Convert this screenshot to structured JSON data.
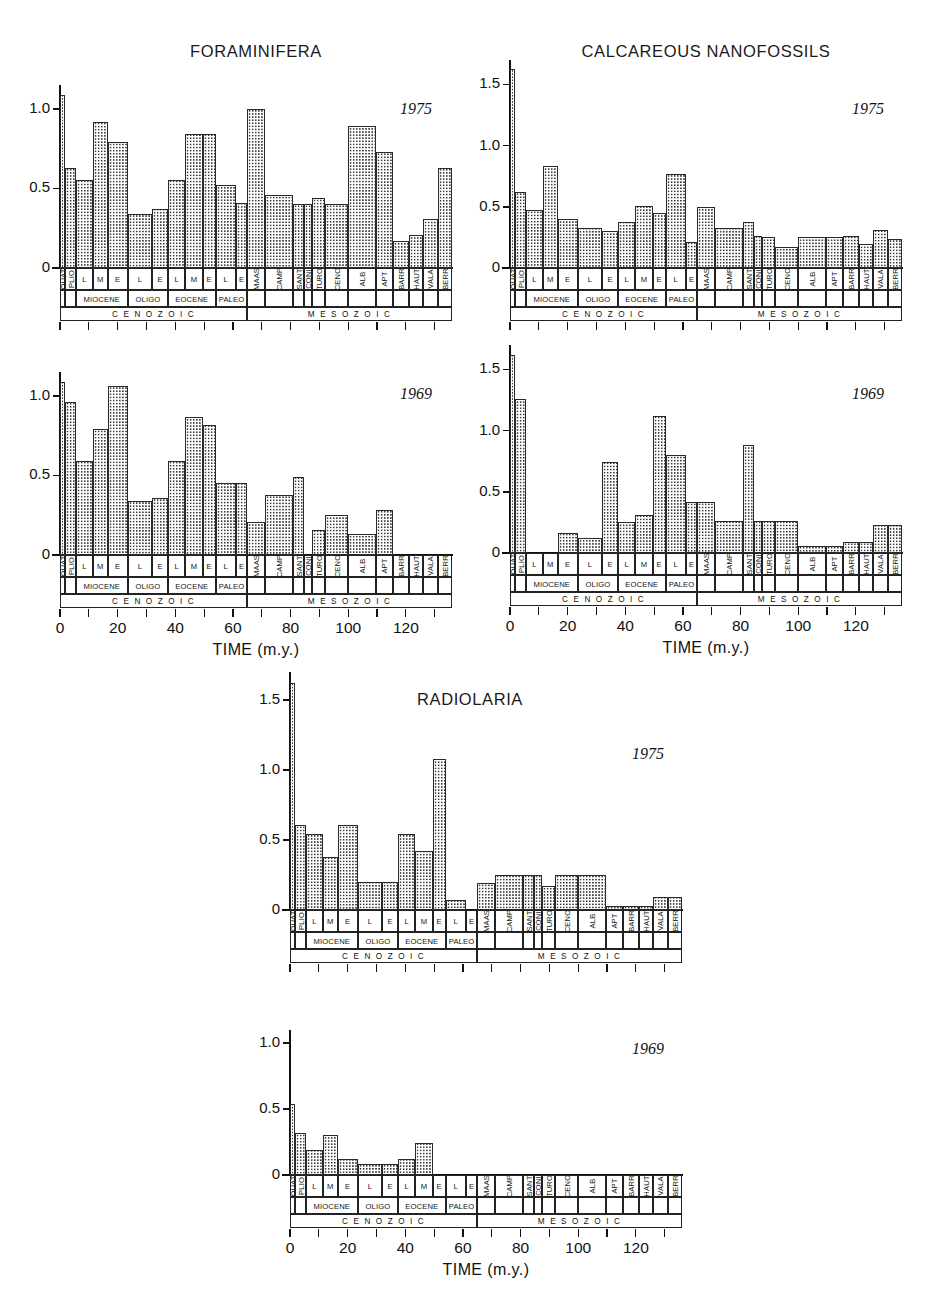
{
  "figure": {
    "background": "#ffffff",
    "bar_outline_color": "#2a2a2a",
    "bar_fill_pattern": "dotted-stipple",
    "axis_color": "#111111"
  },
  "axis": {
    "x_title": "TIME  (m.y.)",
    "x_ticks": [
      0,
      10,
      20,
      30,
      40,
      50,
      60,
      70,
      80,
      90,
      100,
      110,
      120,
      130
    ],
    "x_tick_labels": [
      "0",
      "",
      "20",
      "",
      "40",
      "",
      "60",
      "",
      "80",
      "",
      "100",
      "",
      "120",
      ""
    ],
    "x_range": [
      0,
      136
    ],
    "y_ticks_15": [
      "0",
      "0.5",
      "1.0",
      "1.5"
    ],
    "y_ticks_10": [
      "0",
      "0.5",
      "1.0"
    ]
  },
  "stratigraphy": {
    "epochs": [
      {
        "label": "QUAT",
        "start": 0,
        "end": 1.8,
        "orient": "vert"
      },
      {
        "label": "PLIO",
        "start": 1.8,
        "end": 5.5,
        "orient": "vert"
      },
      {
        "label": "L",
        "start": 5.5,
        "end": 11.5,
        "orient": "horiz"
      },
      {
        "label": "M",
        "start": 11.5,
        "end": 16.5,
        "orient": "horiz"
      },
      {
        "label": "E",
        "start": 16.5,
        "end": 23.5,
        "orient": "horiz"
      },
      {
        "label": "L",
        "start": 23.5,
        "end": 32.0,
        "orient": "horiz"
      },
      {
        "label": "E",
        "start": 32.0,
        "end": 37.5,
        "orient": "horiz"
      },
      {
        "label": "L",
        "start": 37.5,
        "end": 43.5,
        "orient": "horiz"
      },
      {
        "label": "M",
        "start": 43.5,
        "end": 49.5,
        "orient": "horiz"
      },
      {
        "label": "E",
        "start": 49.5,
        "end": 54.0,
        "orient": "horiz"
      },
      {
        "label": "L",
        "start": 54.0,
        "end": 61.0,
        "orient": "horiz"
      },
      {
        "label": "E",
        "start": 61.0,
        "end": 65.0,
        "orient": "horiz"
      },
      {
        "label": "MAAS",
        "start": 65.0,
        "end": 71.0,
        "orient": "vert"
      },
      {
        "label": "CAMP",
        "start": 71.0,
        "end": 81.0,
        "orient": "vert"
      },
      {
        "label": "SANT",
        "start": 81.0,
        "end": 84.5,
        "orient": "vert"
      },
      {
        "label": "CONI",
        "start": 84.5,
        "end": 87.5,
        "orient": "vert"
      },
      {
        "label": "TURO",
        "start": 87.5,
        "end": 92.0,
        "orient": "vert"
      },
      {
        "label": "CENO",
        "start": 92.0,
        "end": 100.0,
        "orient": "vert"
      },
      {
        "label": "ALB",
        "start": 100.0,
        "end": 109.5,
        "orient": "vert"
      },
      {
        "label": "APT",
        "start": 109.5,
        "end": 115.5,
        "orient": "vert"
      },
      {
        "label": "BARR",
        "start": 115.5,
        "end": 121.0,
        "orient": "vert"
      },
      {
        "label": "HAUT",
        "start": 121.0,
        "end": 126.0,
        "orient": "vert"
      },
      {
        "label": "VALA",
        "start": 126.0,
        "end": 131.0,
        "orient": "vert"
      },
      {
        "label": "BERR",
        "start": 131.0,
        "end": 136.0,
        "orient": "vert"
      }
    ],
    "periods": [
      {
        "label": "MIOCENE",
        "start": 5.5,
        "end": 23.5
      },
      {
        "label": "OLIGO",
        "start": 23.5,
        "end": 37.5
      },
      {
        "label": "EOCENE",
        "start": 37.5,
        "end": 54.0
      },
      {
        "label": "PALEO",
        "start": 54.0,
        "end": 65.0
      }
    ],
    "eras": [
      {
        "label": "C E N O Z O I C",
        "start": 0.0,
        "end": 65.0
      },
      {
        "label": "M E S O Z O I C",
        "start": 65.0,
        "end": 136.0
      }
    ]
  },
  "chart_data": [
    {
      "id": "foraminifera-1975",
      "type": "bar",
      "title": "FORAMINIFERA",
      "year": "1975",
      "xlabel": "TIME  (m.y.)",
      "ylabel": "",
      "ylim": [
        0,
        1.15
      ],
      "yticks": [
        0,
        0.5,
        1.0
      ],
      "ytick_labels": [
        "0",
        "0.5",
        "1.0"
      ],
      "show_xaxis_labels": false,
      "categories": [
        "QUAT",
        "PLIO",
        "L",
        "M",
        "E",
        "L",
        "E",
        "L",
        "M",
        "E",
        "L",
        "E",
        "MAAS",
        "CAMP",
        "SANT",
        "CONI",
        "TURO",
        "CENO",
        "ALB",
        "APT",
        "BARR",
        "HAUT",
        "VALA",
        "BERR"
      ],
      "x_start": [
        0,
        1.8,
        5.5,
        11.5,
        16.5,
        23.5,
        32,
        37.5,
        43.5,
        49.5,
        54,
        61,
        65,
        71,
        81,
        84.5,
        87.5,
        92,
        100,
        109.5,
        115.5,
        121,
        126,
        131
      ],
      "x_end": [
        1.8,
        5.5,
        11.5,
        16.5,
        23.5,
        32,
        37.5,
        43.5,
        49.5,
        54,
        61,
        65,
        71,
        81,
        84.5,
        87.5,
        92,
        100,
        109.5,
        115.5,
        121,
        126,
        131,
        136
      ],
      "values": [
        1.09,
        0.63,
        0.55,
        0.92,
        0.79,
        0.34,
        0.37,
        0.55,
        0.84,
        0.84,
        0.52,
        0.41,
        1.0,
        0.46,
        0.4,
        0.4,
        0.44,
        0.4,
        0.89,
        0.73,
        0.17,
        0.21,
        0.31,
        0.63
      ]
    },
    {
      "id": "calcareous-nanofossils-1975",
      "type": "bar",
      "title": "CALCAREOUS NANOFOSSILS",
      "year": "1975",
      "xlabel": "TIME  (m.y.)",
      "ylabel": "",
      "ylim": [
        0,
        1.7
      ],
      "yticks": [
        0,
        0.5,
        1.0,
        1.5
      ],
      "ytick_labels": [
        "0",
        "0.5",
        "1.0",
        "1.5"
      ],
      "show_xaxis_labels": false,
      "categories": [
        "QUAT",
        "PLIO",
        "L",
        "M",
        "E",
        "L",
        "E",
        "L",
        "M",
        "E",
        "L",
        "E",
        "MAAS",
        "CAMP",
        "SANT",
        "CONI",
        "TURO",
        "CENO",
        "ALB",
        "APT",
        "BARR",
        "HAUT",
        "VALA",
        "BERR"
      ],
      "x_start": [
        0,
        1.8,
        5.5,
        11.5,
        16.5,
        23.5,
        32,
        37.5,
        43.5,
        49.5,
        54,
        61,
        65,
        71,
        81,
        84.5,
        87.5,
        92,
        100,
        109.5,
        115.5,
        121,
        126,
        131
      ],
      "x_end": [
        1.8,
        5.5,
        11.5,
        16.5,
        23.5,
        32,
        37.5,
        43.5,
        49.5,
        54,
        61,
        65,
        71,
        81,
        84.5,
        87.5,
        92,
        100,
        109.5,
        115.5,
        121,
        126,
        131,
        136
      ],
      "values": [
        1.63,
        0.62,
        0.47,
        0.83,
        0.4,
        0.33,
        0.3,
        0.38,
        0.51,
        0.45,
        0.77,
        0.21,
        0.5,
        0.33,
        0.38,
        0.26,
        0.25,
        0.17,
        0.25,
        0.25,
        0.26,
        0.2,
        0.31,
        0.24
      ]
    },
    {
      "id": "foraminifera-1969",
      "type": "bar",
      "title": "",
      "year": "1969",
      "xlabel": "TIME  (m.y.)",
      "ylabel": "",
      "ylim": [
        0,
        1.15
      ],
      "yticks": [
        0,
        0.5,
        1.0
      ],
      "ytick_labels": [
        "0",
        "0.5",
        "1.0"
      ],
      "show_xaxis_labels": true,
      "categories": [
        "QUAT",
        "PLIO",
        "L",
        "M",
        "E",
        "L",
        "E",
        "L",
        "M",
        "E",
        "L",
        "E",
        "MAAS",
        "CAMP",
        "SANT",
        "CONI",
        "TURO",
        "CENO",
        "ALB",
        "APT",
        "BARR",
        "HAUT",
        "VALA",
        "BERR"
      ],
      "x_start": [
        0,
        1.8,
        5.5,
        11.5,
        16.5,
        23.5,
        32,
        37.5,
        43.5,
        49.5,
        54,
        61,
        65,
        71,
        81,
        84.5,
        87.5,
        92,
        100,
        109.5,
        115.5,
        121,
        126,
        131
      ],
      "x_end": [
        1.8,
        5.5,
        11.5,
        16.5,
        23.5,
        32,
        37.5,
        43.5,
        49.5,
        54,
        61,
        65,
        71,
        81,
        84.5,
        87.5,
        92,
        100,
        109.5,
        115.5,
        121,
        126,
        131,
        136
      ],
      "values": [
        1.09,
        0.96,
        0.59,
        0.79,
        1.06,
        0.34,
        0.36,
        0.59,
        0.87,
        0.82,
        0.45,
        0.45,
        0.21,
        0.38,
        0.49,
        0.0,
        0.16,
        0.25,
        0.13,
        0.28,
        0.0,
        0.0,
        0.0,
        0.0
      ]
    },
    {
      "id": "calcareous-nanofossils-1969",
      "type": "bar",
      "title": "",
      "year": "1969",
      "xlabel": "TIME  (m.y.)",
      "ylabel": "",
      "ylim": [
        0,
        1.7
      ],
      "yticks": [
        0,
        0.5,
        1.0,
        1.5
      ],
      "ytick_labels": [
        "0",
        "0.5",
        "1.0",
        "1.5"
      ],
      "show_xaxis_labels": true,
      "categories": [
        "QUAT",
        "PLIO",
        "L",
        "M",
        "E",
        "L",
        "E",
        "L",
        "M",
        "E",
        "L",
        "E",
        "MAAS",
        "CAMP",
        "SANT",
        "CONI",
        "TURO",
        "CENO",
        "ALB",
        "APT",
        "BARR",
        "HAUT",
        "VALA",
        "BERR"
      ],
      "x_start": [
        0,
        1.8,
        5.5,
        11.5,
        16.5,
        23.5,
        32,
        37.5,
        43.5,
        49.5,
        54,
        61,
        65,
        71,
        81,
        84.5,
        87.5,
        92,
        100,
        109.5,
        115.5,
        121,
        126,
        131
      ],
      "x_end": [
        1.8,
        5.5,
        11.5,
        16.5,
        23.5,
        32,
        37.5,
        43.5,
        49.5,
        54,
        61,
        65,
        71,
        81,
        84.5,
        87.5,
        92,
        100,
        109.5,
        115.5,
        121,
        126,
        131,
        136
      ],
      "values": [
        1.62,
        1.26,
        0.0,
        0.0,
        0.16,
        0.12,
        0.74,
        0.25,
        0.31,
        1.12,
        0.8,
        0.42,
        0.42,
        0.26,
        0.88,
        0.26,
        0.26,
        0.26,
        0.06,
        0.06,
        0.09,
        0.09,
        0.23,
        0.23
      ]
    },
    {
      "id": "radiolaria-1975",
      "type": "bar",
      "title": "RADIOLARIA",
      "year": "1975",
      "xlabel": "TIME  (m.y.)",
      "ylabel": "",
      "ylim": [
        0,
        1.7
      ],
      "yticks": [
        0,
        0.5,
        1.0,
        1.5
      ],
      "ytick_labels": [
        "0",
        "0.5",
        "1.0",
        "1.5"
      ],
      "show_xaxis_labels": false,
      "categories": [
        "QUAT",
        "PLIO",
        "L",
        "M",
        "E",
        "L",
        "E",
        "L",
        "M",
        "E",
        "L",
        "E",
        "MAAS",
        "CAMP",
        "SANT",
        "CONI",
        "TURO",
        "CENO",
        "ALB",
        "APT",
        "BARR",
        "HAUT",
        "VALA",
        "BERR"
      ],
      "x_start": [
        0,
        1.8,
        5.5,
        11.5,
        16.5,
        23.5,
        32,
        37.5,
        43.5,
        49.5,
        54,
        61,
        65,
        71,
        81,
        84.5,
        87.5,
        92,
        100,
        109.5,
        115.5,
        121,
        126,
        131
      ],
      "x_end": [
        1.8,
        5.5,
        11.5,
        16.5,
        23.5,
        32,
        37.5,
        43.5,
        49.5,
        54,
        61,
        65,
        71,
        81,
        84.5,
        87.5,
        92,
        100,
        109.5,
        115.5,
        121,
        126,
        131,
        136
      ],
      "values": [
        1.62,
        0.61,
        0.54,
        0.38,
        0.61,
        0.2,
        0.2,
        0.54,
        0.42,
        1.08,
        0.07,
        0.0,
        0.19,
        0.25,
        0.25,
        0.25,
        0.17,
        0.25,
        0.25,
        0.03,
        0.03,
        0.03,
        0.09,
        0.09
      ]
    },
    {
      "id": "radiolaria-1969",
      "type": "bar",
      "title": "",
      "year": "1969",
      "xlabel": "TIME  (m.y.)",
      "ylabel": "",
      "ylim": [
        0,
        1.1
      ],
      "yticks": [
        0,
        0.5,
        1.0
      ],
      "ytick_labels": [
        "0",
        "0.5",
        "1.0"
      ],
      "show_xaxis_labels": true,
      "categories": [
        "QUAT",
        "PLIO",
        "L",
        "M",
        "E",
        "L",
        "E",
        "L",
        "M",
        "E",
        "L",
        "E",
        "MAAS",
        "CAMP",
        "SANT",
        "CONI",
        "TURO",
        "CENO",
        "ALB",
        "APT",
        "BARR",
        "HAUT",
        "VALA",
        "BERR"
      ],
      "x_start": [
        0,
        1.8,
        5.5,
        11.5,
        16.5,
        23.5,
        32,
        37.5,
        43.5,
        49.5,
        54,
        61,
        65,
        71,
        81,
        84.5,
        87.5,
        92,
        100,
        109.5,
        115.5,
        121,
        126,
        131
      ],
      "x_end": [
        1.8,
        5.5,
        11.5,
        16.5,
        23.5,
        32,
        37.5,
        43.5,
        49.5,
        54,
        61,
        65,
        71,
        81,
        84.5,
        87.5,
        92,
        100,
        109.5,
        115.5,
        121,
        126,
        131,
        136
      ],
      "values": [
        0.54,
        0.32,
        0.19,
        0.3,
        0.12,
        0.08,
        0.08,
        0.12,
        0.24,
        0.0,
        0.0,
        0.0,
        0.0,
        0.0,
        0.0,
        0.0,
        0.0,
        0.0,
        0.0,
        0.0,
        0.0,
        0.0,
        0.0,
        0.0
      ]
    }
  ],
  "layout": [
    {
      "chart": 0,
      "left": 60,
      "top": 85,
      "width": 392,
      "height": 183,
      "strat_top": 268,
      "title_x": 256,
      "title_y": 42,
      "year_x": 400,
      "year_y": 100
    },
    {
      "chart": 1,
      "left": 510,
      "top": 60,
      "width": 392,
      "height": 208,
      "strat_top": 268,
      "title_x": 706,
      "title_y": 42,
      "year_x": 852,
      "year_y": 100
    },
    {
      "chart": 2,
      "left": 60,
      "top": 372,
      "width": 392,
      "height": 183,
      "strat_top": 555,
      "title_x": 256,
      "title_y": 340,
      "year_x": 400,
      "year_y": 385
    },
    {
      "chart": 3,
      "left": 510,
      "top": 345,
      "width": 392,
      "height": 208,
      "strat_top": 553,
      "title_x": 706,
      "title_y": 330,
      "year_x": 852,
      "year_y": 385
    },
    {
      "chart": 4,
      "left": 290,
      "top": 672,
      "width": 392,
      "height": 238,
      "strat_top": 910,
      "title_x": 470,
      "title_y": 690,
      "year_x": 632,
      "year_y": 745
    },
    {
      "chart": 5,
      "left": 290,
      "top": 1030,
      "width": 392,
      "height": 145,
      "strat_top": 1175,
      "title_x": 470,
      "title_y": 1010,
      "year_x": 632,
      "year_y": 1040
    }
  ]
}
